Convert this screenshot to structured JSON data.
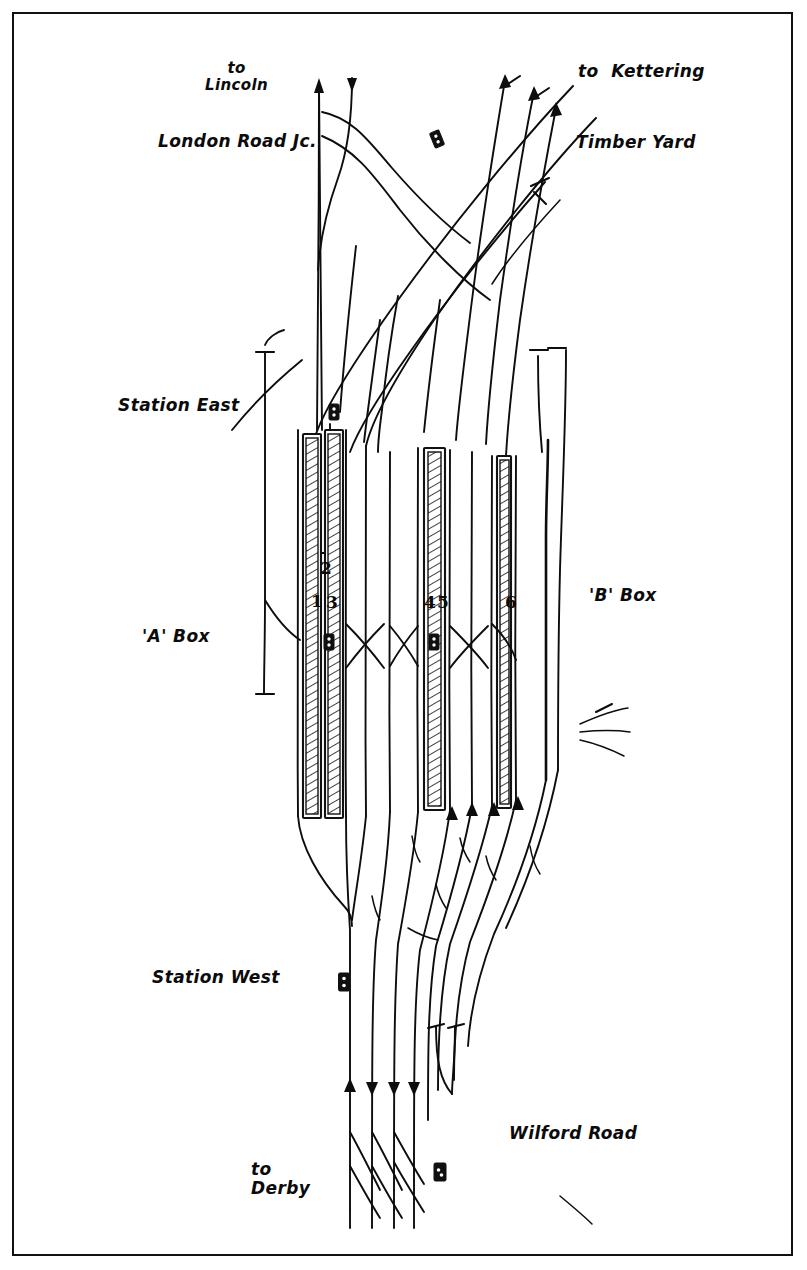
{
  "frame": {
    "border_color": "#111111",
    "background": "#ffffff",
    "ink_color": "#0b0b0b"
  },
  "labels": {
    "to_lincoln": "to\nLincoln",
    "london_road_jc": "London Road Jc.",
    "to_kettering": "to  Kettering",
    "timber_yard": "Timber Yard",
    "station_east": "Station East",
    "a_box": "'A' Box",
    "b_box": "'B' Box",
    "station_west": "Station West",
    "wilford_road": "Wilford Road",
    "to_derby": "to\nDerby"
  },
  "platform_numbers": [
    {
      "id": "platform-1",
      "text": "1",
      "x": 311,
      "y": 591
    },
    {
      "id": "platform-2",
      "text": "2",
      "x": 320,
      "y": 558
    },
    {
      "id": "platform-3",
      "text": "3",
      "x": 326,
      "y": 592
    },
    {
      "id": "platform-4",
      "text": "4",
      "x": 424,
      "y": 592
    },
    {
      "id": "platform-5",
      "text": "5",
      "x": 437,
      "y": 592
    },
    {
      "id": "platform-6",
      "text": "6",
      "x": 505,
      "y": 592
    }
  ],
  "platforms": [
    {
      "id": "platform-face-west-a",
      "x": 303,
      "y": 434,
      "w": 16,
      "h": 382
    },
    {
      "id": "platform-face-bay-2",
      "x": 325,
      "y": 430,
      "w": 16,
      "h": 125
    },
    {
      "id": "platform-face-east-a",
      "x": 325,
      "y": 430,
      "w": 16,
      "h": 386
    },
    {
      "id": "platform-face-b",
      "x": 424,
      "y": 448,
      "w": 19,
      "h": 360
    },
    {
      "id": "platform-face-c",
      "x": 497,
      "y": 456,
      "w": 13,
      "h": 350
    }
  ],
  "signal_boxes": [
    {
      "id": "signal-marker-kettering-throat",
      "x": 437,
      "y": 139,
      "rot": -22
    },
    {
      "id": "signal-marker-station-east",
      "x": 334,
      "y": 412,
      "rot": 0
    },
    {
      "id": "signal-marker-a-box",
      "x": 329,
      "y": 642,
      "rot": 0
    },
    {
      "id": "signal-marker-b-box",
      "x": 434,
      "y": 642,
      "rot": 0
    },
    {
      "id": "signal-marker-station-west",
      "x": 344,
      "y": 982,
      "rot": 0
    },
    {
      "id": "signal-marker-wilford-road",
      "x": 440,
      "y": 1172,
      "rot": 0
    }
  ],
  "destinations": [
    "to Lincoln",
    "to Kettering",
    "Timber Yard",
    "to Derby",
    "Wilford Road"
  ],
  "signal_box_names": [
    "London Road Jc.",
    "'A' Box",
    "'B' Box",
    "Station East",
    "Station West"
  ]
}
